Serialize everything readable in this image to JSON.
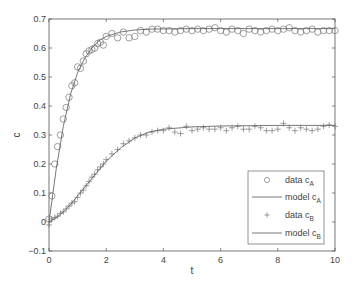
{
  "chart_data": {
    "type": "line",
    "title": "",
    "xlabel": "t",
    "ylabel": "c",
    "xlim": [
      0,
      10
    ],
    "ylim": [
      -0.1,
      0.7
    ],
    "xticks": [
      0,
      2,
      4,
      6,
      8,
      10
    ],
    "yticks": [
      -0.1,
      0,
      0.1,
      0.2,
      0.3,
      0.4,
      0.5,
      0.6,
      0.7
    ],
    "ytick_labels": [
      "-0.1",
      "0",
      "0.1",
      "0.2",
      "0.3",
      "0.4",
      "0.5",
      "0.6",
      "0.7"
    ],
    "xtick_labels": [
      "0",
      "2",
      "4",
      "6",
      "8",
      "10"
    ],
    "grid": false,
    "box": true,
    "legend_position": "lower right",
    "series": [
      {
        "name": "data c_A",
        "legend_main": "data c",
        "legend_sub": "A",
        "style": "marker",
        "marker": "circle",
        "x": [
          0.0,
          0.1,
          0.2,
          0.3,
          0.4,
          0.5,
          0.6,
          0.7,
          0.8,
          0.9,
          1.0,
          1.1,
          1.2,
          1.3,
          1.4,
          1.5,
          1.6,
          1.7,
          1.8,
          1.9,
          2.0,
          2.2,
          2.4,
          2.6,
          2.8,
          3.0,
          3.2,
          3.4,
          3.6,
          3.8,
          4.0,
          4.2,
          4.4,
          4.6,
          4.8,
          5.0,
          5.2,
          5.4,
          5.6,
          5.8,
          6.0,
          6.2,
          6.4,
          6.6,
          6.8,
          7.0,
          7.2,
          7.4,
          7.6,
          7.8,
          8.0,
          8.2,
          8.4,
          8.6,
          8.8,
          9.0,
          9.2,
          9.4,
          9.6,
          9.8,
          10.0
        ],
        "values": [
          0.01,
          0.09,
          0.2,
          0.26,
          0.3,
          0.355,
          0.395,
          0.43,
          0.47,
          0.48,
          0.535,
          0.53,
          0.555,
          0.58,
          0.59,
          0.595,
          0.6,
          0.615,
          0.62,
          0.61,
          0.64,
          0.65,
          0.635,
          0.655,
          0.635,
          0.64,
          0.66,
          0.655,
          0.665,
          0.665,
          0.66,
          0.66,
          0.655,
          0.66,
          0.665,
          0.66,
          0.665,
          0.66,
          0.665,
          0.67,
          0.66,
          0.655,
          0.665,
          0.66,
          0.65,
          0.665,
          0.66,
          0.655,
          0.66,
          0.665,
          0.66,
          0.665,
          0.67,
          0.66,
          0.655,
          0.66,
          0.665,
          0.655,
          0.66,
          0.66,
          0.66
        ]
      },
      {
        "name": "model c_A",
        "legend_main": "model c",
        "legend_sub": "A",
        "style": "line",
        "x": [
          0,
          0.25,
          0.5,
          0.75,
          1.0,
          1.25,
          1.5,
          1.75,
          2.0,
          2.5,
          3.0,
          3.5,
          4.0,
          5.0,
          6.0,
          7.0,
          8.0,
          9.0,
          10.0
        ],
        "values": [
          0.0,
          0.18,
          0.33,
          0.44,
          0.515,
          0.565,
          0.6,
          0.625,
          0.64,
          0.655,
          0.662,
          0.665,
          0.666,
          0.667,
          0.667,
          0.667,
          0.667,
          0.667,
          0.667
        ]
      },
      {
        "name": "data c_B",
        "legend_main": "data c",
        "legend_sub": "B",
        "style": "marker",
        "marker": "plus",
        "x": [
          0.0,
          0.1,
          0.2,
          0.3,
          0.4,
          0.5,
          0.6,
          0.7,
          0.8,
          0.9,
          1.0,
          1.1,
          1.2,
          1.3,
          1.4,
          1.5,
          1.6,
          1.7,
          1.8,
          1.9,
          2.0,
          2.2,
          2.4,
          2.6,
          2.8,
          3.0,
          3.2,
          3.4,
          3.6,
          3.8,
          4.0,
          4.2,
          4.4,
          4.6,
          4.8,
          5.0,
          5.2,
          5.4,
          5.6,
          5.8,
          6.0,
          6.2,
          6.4,
          6.6,
          6.8,
          7.0,
          7.2,
          7.4,
          7.6,
          7.8,
          8.0,
          8.2,
          8.4,
          8.6,
          8.8,
          9.0,
          9.2,
          9.4,
          9.6,
          9.8,
          10.0
        ],
        "values": [
          -0.01,
          0.01,
          0.015,
          0.02,
          0.03,
          0.035,
          0.045,
          0.055,
          0.065,
          0.07,
          0.085,
          0.1,
          0.11,
          0.125,
          0.14,
          0.155,
          0.165,
          0.18,
          0.19,
          0.2,
          0.215,
          0.235,
          0.25,
          0.27,
          0.28,
          0.29,
          0.3,
          0.3,
          0.31,
          0.315,
          0.315,
          0.325,
          0.31,
          0.305,
          0.33,
          0.315,
          0.32,
          0.325,
          0.32,
          0.32,
          0.325,
          0.315,
          0.325,
          0.33,
          0.32,
          0.32,
          0.33,
          0.325,
          0.315,
          0.315,
          0.32,
          0.34,
          0.325,
          0.315,
          0.325,
          0.32,
          0.315,
          0.32,
          0.33,
          0.335,
          0.33
        ]
      },
      {
        "name": "model c_B",
        "legend_main": "model c",
        "legend_sub": "B",
        "style": "line",
        "x": [
          0,
          0.25,
          0.5,
          0.75,
          1.0,
          1.25,
          1.5,
          1.75,
          2.0,
          2.5,
          3.0,
          3.5,
          4.0,
          5.0,
          6.0,
          7.0,
          8.0,
          9.0,
          10.0
        ],
        "values": [
          0.0,
          0.015,
          0.035,
          0.06,
          0.09,
          0.12,
          0.15,
          0.18,
          0.21,
          0.255,
          0.29,
          0.31,
          0.32,
          0.328,
          0.331,
          0.332,
          0.333,
          0.333,
          0.333
        ]
      }
    ],
    "colors": {
      "axis": "#555555",
      "data": "#777777",
      "line": "#555555",
      "background": "#ffffff"
    }
  }
}
